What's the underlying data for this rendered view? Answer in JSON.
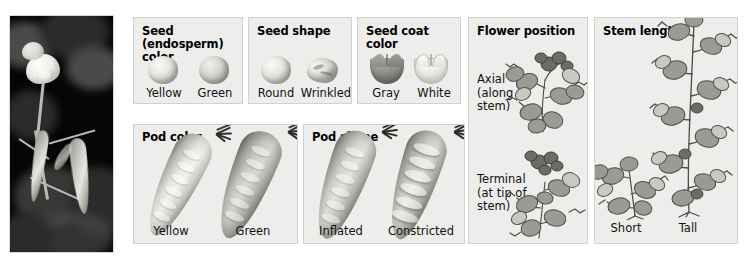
{
  "figure": {
    "background_color": "#ffffff",
    "panel_background": "#ededeb",
    "panel_border": "#d2d2cf"
  },
  "photo": {
    "name": "pea-plant-photograph",
    "description": "Photograph of a pea plant with white flower and hanging pod",
    "caption": ""
  },
  "panels": [
    {
      "id": "seed-color",
      "title": "Seed (endosperm)\ncolor",
      "traits": [
        {
          "label": "Yellow",
          "icon": "round-seed-light"
        },
        {
          "label": "Green",
          "icon": "round-seed-dark"
        }
      ]
    },
    {
      "id": "seed-shape",
      "title": "Seed shape",
      "traits": [
        {
          "label": "Round",
          "icon": "round-seed"
        },
        {
          "label": "Wrinkled",
          "icon": "wrinkled-seed"
        }
      ]
    },
    {
      "id": "seed-coat-color",
      "title": "Seed coat\ncolor",
      "traits": [
        {
          "label": "Gray",
          "icon": "gray-seed-coat"
        },
        {
          "label": "White",
          "icon": "white-seed-coat"
        }
      ]
    },
    {
      "id": "flower-position",
      "title": "Flower position",
      "traits": [
        {
          "label": "Axial\n(along\nstem)",
          "icon": "axial-flower-sprig"
        },
        {
          "label": "Terminal\n(at tip of\nstem)",
          "icon": "terminal-flower-sprig"
        }
      ]
    },
    {
      "id": "stem-length",
      "title": "Stem length",
      "traits": [
        {
          "label": "Short",
          "icon": "short-pea-stem"
        },
        {
          "label": "Tall",
          "icon": "tall-pea-stem"
        }
      ]
    },
    {
      "id": "pod-color",
      "title": "Pod color",
      "traits": [
        {
          "label": "Yellow",
          "icon": "yellow-pea-pod"
        },
        {
          "label": "Green",
          "icon": "green-pea-pod"
        }
      ]
    },
    {
      "id": "pod-shape",
      "title": "Pod shape",
      "traits": [
        {
          "label": "Inflated",
          "icon": "inflated-pea-pod"
        },
        {
          "label": "Constricted",
          "icon": "constricted-pea-pod"
        }
      ]
    }
  ]
}
